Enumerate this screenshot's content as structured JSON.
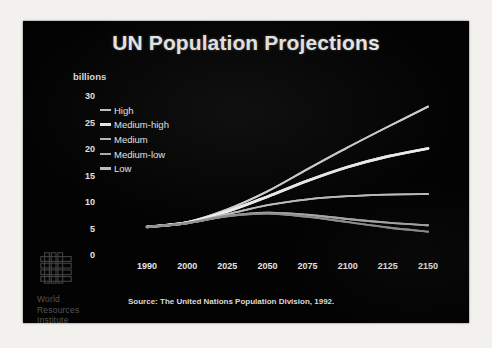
{
  "slide": {
    "title": "UN Population Projections",
    "source_note": "Source: The United Nations Population Division, 1992.",
    "background_color": "#030303",
    "title_color": "#e9e9e9",
    "frame_color": "#f2f1ee"
  },
  "logo": {
    "name": "world-resources-institute-logo",
    "line1": "World",
    "line2": "Resources",
    "line3": "Institute"
  },
  "chart_data": {
    "type": "line",
    "title": "UN Population Projections",
    "xlabel": "",
    "ylabel": "billions",
    "ylim": [
      0,
      30
    ],
    "grid": false,
    "legend_position": "inside-top-left",
    "x_tick_labels": [
      "1990",
      "2000",
      "2025",
      "2050",
      "2075",
      "2100",
      "2125",
      "2150"
    ],
    "y_tick_labels": [
      "30",
      "25",
      "20",
      "15",
      "10",
      "5",
      "0"
    ],
    "y_ticks": [
      30,
      25,
      20,
      15,
      10,
      5,
      0
    ],
    "x": [
      1990,
      2000,
      2025,
      2050,
      2075,
      2100,
      2125,
      2150
    ],
    "series": [
      {
        "name": "High",
        "color": "#d0d0d0",
        "values": [
          5.3,
          6.2,
          8.6,
          12.0,
          16.2,
          20.3,
          24.2,
          28.0
        ]
      },
      {
        "name": "Medium-high",
        "color": "#efefef",
        "values": [
          5.3,
          6.1,
          8.2,
          11.0,
          14.0,
          16.6,
          18.6,
          20.1
        ]
      },
      {
        "name": "Medium",
        "color": "#bdbdbd",
        "values": [
          5.3,
          6.1,
          7.7,
          9.4,
          10.5,
          11.1,
          11.4,
          11.5
        ]
      },
      {
        "name": "Medium-low",
        "color": "#a8a8a8",
        "values": [
          5.3,
          6.0,
          7.4,
          8.0,
          7.6,
          6.8,
          6.1,
          5.6
        ]
      },
      {
        "name": "Low",
        "color": "#8f8f8f",
        "values": [
          5.3,
          6.0,
          7.3,
          7.8,
          7.2,
          6.2,
          5.2,
          4.4
        ]
      }
    ]
  },
  "legend": {
    "items": [
      {
        "label": "High",
        "color": "#c8c8c8",
        "thick": false
      },
      {
        "label": "Medium-high",
        "color": "#efefef",
        "thick": true
      },
      {
        "label": "Medium",
        "color": "#bdbdbd",
        "thick": false
      },
      {
        "label": "Medium-low",
        "color": "#b0b0b0",
        "thick": false
      },
      {
        "label": "Low",
        "color": "#c0c0c0",
        "thick": true
      }
    ]
  }
}
